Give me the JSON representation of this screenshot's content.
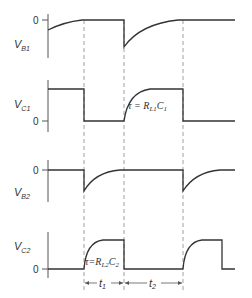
{
  "diagram": {
    "panels": [
      {
        "id": "vb1",
        "label_main": "V",
        "label_sub": "B1",
        "zero_label": "0"
      },
      {
        "id": "vc1",
        "label_main": "V",
        "label_sub": "C1",
        "zero_label": "0",
        "annotation": "τ = R",
        "annotation_sub": "L1",
        "annotation_tail": "C",
        "annotation_tail_sub": "1"
      },
      {
        "id": "vb2",
        "label_main": "V",
        "label_sub": "B2",
        "zero_label": "0"
      },
      {
        "id": "vc2",
        "label_main": "V",
        "label_sub": "C2",
        "zero_label": "0",
        "annotation": "τ=R",
        "annotation_sub": "L2",
        "annotation_tail": "C",
        "annotation_tail_sub": "2"
      }
    ],
    "time_intervals": [
      {
        "label": "t",
        "sub": "1"
      },
      {
        "label": "t",
        "sub": "2"
      }
    ],
    "transition_times_px": [
      84,
      124,
      183
    ]
  }
}
